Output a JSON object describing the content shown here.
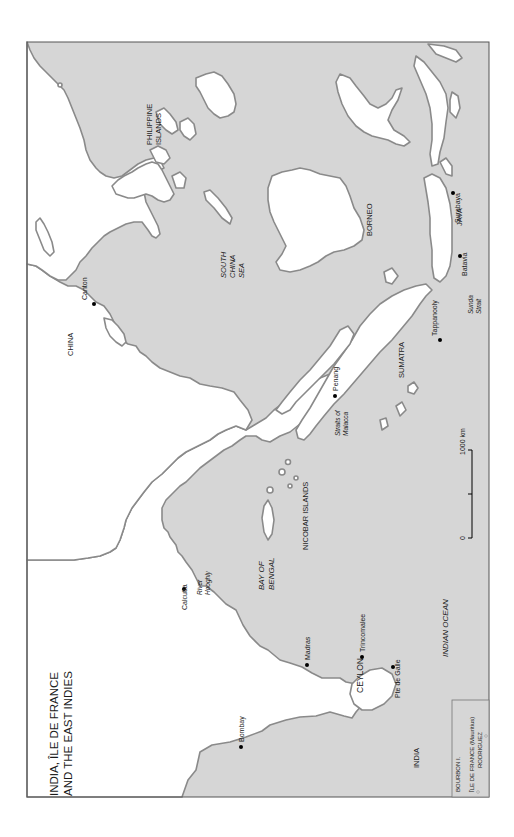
{
  "title": {
    "line1": "INDIA, ÎLE DE FRANCE",
    "line2": "AND THE EAST INDIES"
  },
  "colors": {
    "sea": "#d6d6d6",
    "land": "#ffffff",
    "coast": "#8a8a8a",
    "text": "#1a1a1a"
  },
  "regions": {
    "india": "INDIA",
    "china": "CHINA",
    "ceylon": "CEYLON",
    "sumatra": "SUMATRA",
    "borneo": "BORNEO",
    "java": "JAVA",
    "philippines_1": "PHILIPPINE",
    "philippines_2": "ISLANDS",
    "nicobar": "NICOBAR ISLANDS"
  },
  "seas": {
    "bay_of_bengal_1": "BAY OF",
    "bay_of_bengal_2": "BENGAL",
    "south_china_sea_1": "SOUTH",
    "south_china_sea_2": "CHINA",
    "south_china_sea_3": "SEA",
    "indian_ocean": "INDIAN OCEAN",
    "straits_malacca_1": "Straits of",
    "straits_malacca_2": "Malacca",
    "sunda_strait_1": "Sunda",
    "sunda_strait_2": "Strait",
    "river_hooghly_1": "River",
    "river_hooghly_2": "Hooghly"
  },
  "cities": {
    "bombay": "Bombay",
    "madras": "Madras",
    "calcutta": "Calcutta",
    "trincomalee": "Trincomalee",
    "pte_de_galle": "Pte de Galle",
    "penang": "Penang",
    "tappanooly": "Tappanooly",
    "batavia": "Batavia",
    "surabaya": "Surabaya",
    "canton": "Canton"
  },
  "scale": {
    "zero": "0",
    "max": "1000 km"
  },
  "inset": {
    "bourbon": "BOURBON I.",
    "ile_de_france": "ÎLE DE FRANCE (Mauritius)",
    "rodriguez": "RODRIGUEZ"
  }
}
